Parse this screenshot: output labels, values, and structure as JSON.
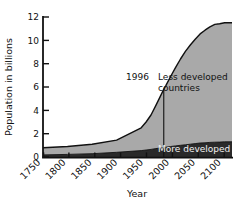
{
  "chart_data": {
    "type": "area",
    "title": "",
    "xlabel": "Year",
    "ylabel": "Population in billions",
    "xlim": [
      1750,
      2135
    ],
    "ylim": [
      0,
      12
    ],
    "xticks": [
      1750,
      1800,
      1850,
      1900,
      1950,
      2000,
      2050,
      2100
    ],
    "xtick_labels": [
      "1750",
      "1800",
      "1850",
      "1900",
      "1950",
      "2000",
      "2050",
      "2100"
    ],
    "yticks": [
      0,
      2,
      4,
      6,
      8,
      10,
      12
    ],
    "ytick_labels": [
      "0",
      "2",
      "4",
      "6",
      "8",
      "10",
      "12"
    ],
    "grid": false,
    "legend_position": "inline-annotations",
    "stacked": true,
    "x": [
      1750,
      1800,
      1850,
      1900,
      1950,
      1960,
      1970,
      1980,
      1990,
      1996,
      2000,
      2010,
      2020,
      2030,
      2040,
      2050,
      2060,
      2070,
      2080,
      2090,
      2100,
      2110,
      2120,
      2135
    ],
    "series": [
      {
        "name": "More developed",
        "color": "#2a2a2a",
        "values": [
          0.18,
          0.22,
          0.28,
          0.4,
          0.55,
          0.6,
          0.65,
          0.72,
          0.78,
          0.82,
          0.84,
          0.9,
          0.95,
          1.0,
          1.05,
          1.1,
          1.15,
          1.2,
          1.22,
          1.25,
          1.27,
          1.28,
          1.3,
          1.3
        ]
      },
      {
        "name": "Less developed countries",
        "color": "#a9a9a9",
        "values": [
          0.62,
          0.68,
          0.82,
          1.05,
          1.95,
          2.4,
          2.95,
          3.7,
          4.5,
          5.0,
          5.26,
          6.0,
          6.7,
          7.4,
          8.0,
          8.5,
          8.95,
          9.35,
          9.65,
          9.9,
          10.1,
          10.15,
          10.2,
          10.2
        ]
      }
    ],
    "totals": [
      0.8,
      0.9,
      1.1,
      1.45,
      2.5,
      3.0,
      3.6,
      4.42,
      5.28,
      5.82,
      6.1,
      6.9,
      7.65,
      8.4,
      9.05,
      9.6,
      10.1,
      10.55,
      10.87,
      11.15,
      11.37,
      11.43,
      11.5,
      11.5
    ],
    "annotations": [
      {
        "name": "year-marker",
        "label": "1996",
        "x": 1996,
        "y_from": 0,
        "y_to": 5.82
      },
      {
        "name": "less-developed-label",
        "label_line1": "Less developed",
        "label_line2": "countries",
        "x": 2005,
        "y": 6.2
      },
      {
        "name": "more-developed-label",
        "label": "More developed",
        "x": 2005,
        "y": 0.95
      }
    ]
  },
  "labels": {
    "y_axis_title": "Population in billions",
    "x_axis_title": "Year",
    "year_marker": "1996",
    "less_developed_line1": "Less developed",
    "less_developed_line2": "countries",
    "more_developed": "More developed",
    "ytick_0": "0",
    "ytick_2": "2",
    "ytick_4": "4",
    "ytick_6": "6",
    "ytick_8": "8",
    "ytick_10": "10",
    "ytick_12": "12",
    "xtick_1750": "1750",
    "xtick_1800": "1800",
    "xtick_1850": "1850",
    "xtick_1900": "1900",
    "xtick_1950": "1950",
    "xtick_2000": "2000",
    "xtick_2050": "2050",
    "xtick_2100": "2100"
  },
  "colors": {
    "background": "#ffffff",
    "axis": "#111111",
    "less_developed_fill": "#a9a9a9",
    "more_developed_fill": "#2a2a2a",
    "curve_stroke": "#111111",
    "light_text": "#f2f2f2",
    "dark_text": "#111111"
  }
}
